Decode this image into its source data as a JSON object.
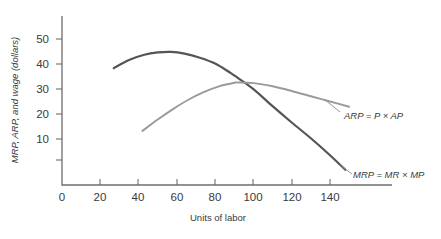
{
  "chart_data": {
    "type": "line",
    "title": "",
    "xlabel": "Units of labor",
    "ylabel": "MRP, ARP, and wage (dollars)",
    "xlim": [
      0,
      158
    ],
    "ylim": [
      0,
      58
    ],
    "xticks": [
      0,
      20,
      40,
      60,
      80,
      100,
      120,
      140
    ],
    "yticks": [
      10,
      20,
      30,
      40,
      50
    ],
    "grid": false,
    "legend_position": "inline-right",
    "series": [
      {
        "name": "MRP = MR × MP",
        "color": "#555555",
        "x": [
          27,
          35,
          43,
          50,
          57,
          64,
          72,
          80,
          88,
          92,
          100,
          110,
          120,
          130,
          140,
          148
        ],
        "y": [
          40.0,
          42.8,
          44.6,
          45.4,
          45.6,
          45.0,
          43.6,
          41.6,
          38.4,
          36.6,
          32.8,
          27.0,
          21.4,
          16.0,
          10.2,
          5.2
        ]
      },
      {
        "name": "ARP = P × AP",
        "color": "#9a9a9a",
        "x": [
          42,
          50,
          58,
          66,
          74,
          82,
          90,
          92,
          100,
          110,
          120,
          130,
          140,
          150
        ],
        "y": [
          18.5,
          22.4,
          26.0,
          29.2,
          31.8,
          33.8,
          35.0,
          35.1,
          34.9,
          33.8,
          32.2,
          30.4,
          28.6,
          26.8
        ]
      }
    ],
    "annotations": [
      {
        "text": "ARP = P × AP",
        "for": "ARP = P × AP"
      },
      {
        "text": "MRP = MR × MP",
        "for": "MRP = MR × MP"
      }
    ]
  },
  "ticks": {
    "x": [
      "0",
      "20",
      "40",
      "60",
      "80",
      "100",
      "120",
      "140"
    ],
    "y": [
      "10",
      "20",
      "30",
      "40",
      "50"
    ]
  },
  "labels": {
    "x_axis_title": "Units of labor",
    "y_axis_title": "MRP, ARP, and wage (dollars)",
    "arp_label": "ARP = P × AP",
    "mrp_label": "MRP = MR × MP"
  },
  "colors": {
    "mrp": "#555555",
    "arp": "#9a9a9a",
    "axis": "#6d6d6d",
    "text": "#3a3a3a",
    "background": "#ffffff"
  }
}
